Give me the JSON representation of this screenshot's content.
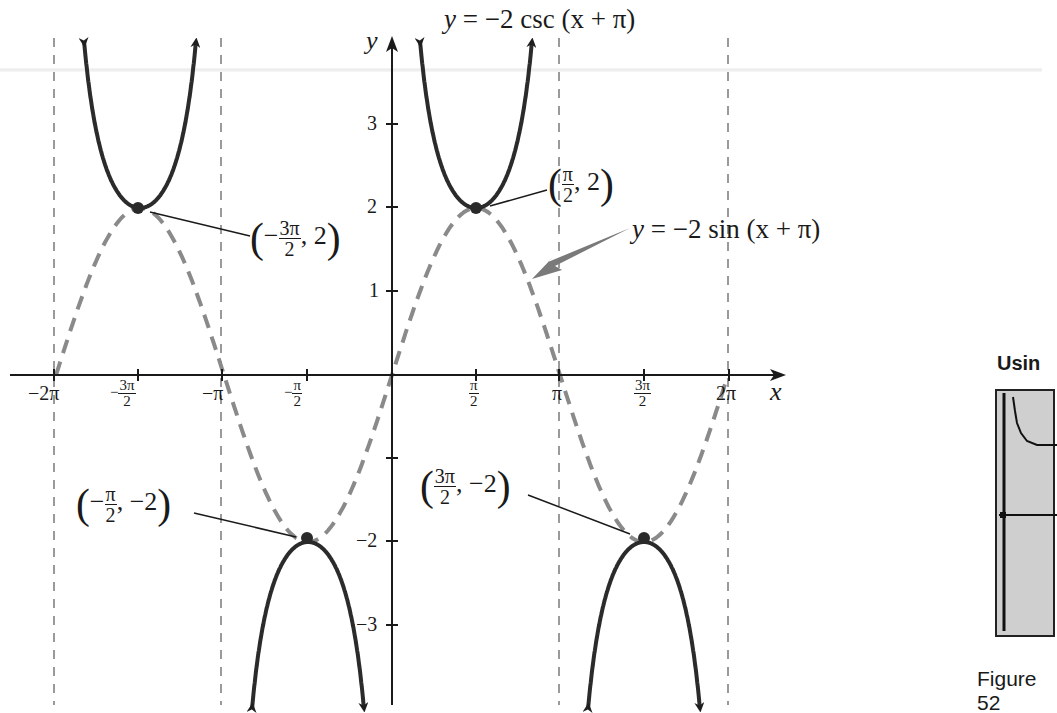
{
  "chart_data": {
    "type": "line",
    "title": "y = −2 csc (x + π)",
    "xlabel": "x",
    "ylabel": "y",
    "xlim": [
      -6.8,
      7.0
    ],
    "ylim": [
      -3.8,
      4.2
    ],
    "grid": false,
    "x_ticks": [
      "−2π",
      "−3π/2",
      "−π",
      "−π/2",
      "π/2",
      "π",
      "3π/2",
      "2π"
    ],
    "x_tick_values": [
      -6.2832,
      -4.7124,
      -3.1416,
      -1.5708,
      1.5708,
      3.1416,
      4.7124,
      6.2832
    ],
    "y_ticks": [
      "3",
      "2",
      "1",
      "−2",
      "−3"
    ],
    "y_tick_values": [
      3,
      2,
      1,
      -1,
      -2,
      -3
    ],
    "asymptotes_x": [
      -6.2832,
      -3.1416,
      0,
      3.1416,
      6.2832
    ],
    "series": [
      {
        "name": "y = −2 csc (x + π)",
        "style": "solid",
        "color": "#2b2b2b",
        "description": "cosecant branches between asymptotes, with arrows",
        "branches": [
          {
            "interval": [
              -6.2832,
              -3.1416
            ],
            "vertex": [
              -4.7124,
              2
            ],
            "opens": "up"
          },
          {
            "interval": [
              -3.1416,
              0
            ],
            "vertex": [
              -1.5708,
              -2
            ],
            "opens": "down"
          },
          {
            "interval": [
              0,
              3.1416
            ],
            "vertex": [
              1.5708,
              2
            ],
            "opens": "up"
          },
          {
            "interval": [
              3.1416,
              6.2832
            ],
            "vertex": [
              4.7124,
              -2
            ],
            "opens": "down"
          }
        ]
      },
      {
        "name": "y = −2 sin (x + π)",
        "style": "dashed",
        "color": "#8a8a8a",
        "x": [
          -6.2832,
          -4.7124,
          -3.1416,
          -1.5708,
          0,
          1.5708,
          3.1416,
          4.7124,
          6.2832
        ],
        "y": [
          0,
          2,
          0,
          -2,
          0,
          2,
          0,
          -2,
          0
        ]
      }
    ],
    "points": [
      {
        "x": -4.7124,
        "y": 2,
        "label": "(−3π/2, 2)"
      },
      {
        "x": 1.5708,
        "y": 2,
        "label": "(π/2, 2)"
      },
      {
        "x": -1.5708,
        "y": -2,
        "label": "(−π/2, −2)"
      },
      {
        "x": 4.7124,
        "y": -2,
        "label": "(3π/2, −2)"
      }
    ],
    "annotations": [
      {
        "text": "y = −2 csc (x + π)",
        "position": "top"
      },
      {
        "text": "y = −2 sin (x + π)",
        "arrow_to": [
          2.3,
          1.1
        ]
      }
    ]
  },
  "labels": {
    "title_y": "y",
    "title_eq": " = −2 csc (x + π)",
    "sin_y": "y",
    "sin_eq": " = −2 sin (x + π)",
    "axis_x": "x",
    "axis_y": "y",
    "xt_m2pi": "−2π",
    "xt_m3pi2_sign": "−",
    "xt_m3pi2_num": "3π",
    "xt_m3pi2_den": "2",
    "xt_mpi": "−π",
    "xt_mpi2_sign": "−",
    "xt_mpi2_num": "π",
    "xt_mpi2_den": "2",
    "xt_pi2_num": "π",
    "xt_pi2_den": "2",
    "xt_pi": "π",
    "xt_3pi2_num": "3π",
    "xt_3pi2_den": "2",
    "xt_2pi": "2π",
    "yt_3": "3",
    "yt_2": "2",
    "yt_1": "1",
    "yt_m2": "−2",
    "yt_m3": "−3",
    "p1_open": "(",
    "p1_sign": "−",
    "p1_num": "3π",
    "p1_den": "2",
    "p1_rest": ", 2",
    "p1_close": ")",
    "p2_open": "(",
    "p2_num": "π",
    "p2_den": "2",
    "p2_rest": ", 2",
    "p2_close": ")",
    "p3_open": "(",
    "p3_sign": "−",
    "p3_num": "π",
    "p3_den": "2",
    "p3_rest": ", −2",
    "p3_close": ")",
    "p4_open": "(",
    "p4_num": "3π",
    "p4_den": "2",
    "p4_rest": ", −2",
    "p4_close": ")"
  },
  "sidebar": {
    "heading_partial": "Usin",
    "figure_caption": "Figure 52"
  }
}
